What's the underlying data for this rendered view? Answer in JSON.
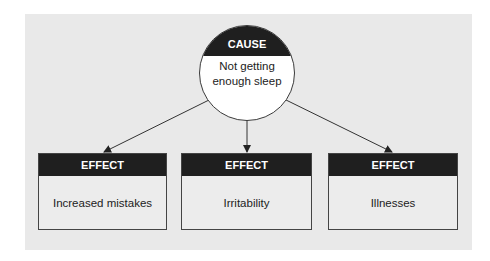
{
  "cause": {
    "header": "CAUSE",
    "text": "Not getting enough sleep"
  },
  "effects": [
    {
      "header": "EFFECT",
      "text": "Increased mistakes"
    },
    {
      "header": "EFFECT",
      "text": "Irritability"
    },
    {
      "header": "EFFECT",
      "text": "Illnesses"
    }
  ],
  "colors": {
    "panel": "#e9e9e9",
    "header": "#1f1f1f",
    "arrow": "#333333"
  }
}
